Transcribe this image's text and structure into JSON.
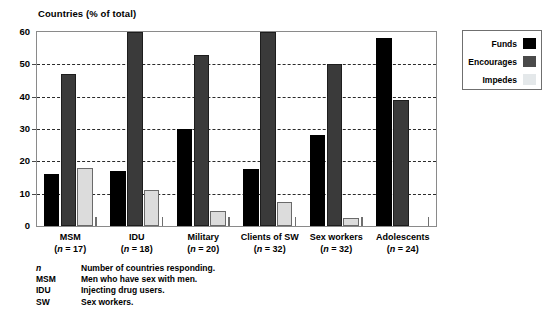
{
  "chart_data": {
    "type": "bar",
    "title": "Countries (% of total)",
    "ylabel": "Countries (% of total)",
    "xlabel": "",
    "ylim": [
      0,
      60
    ],
    "yticks": [
      0,
      10,
      20,
      30,
      40,
      50,
      60
    ],
    "ytick_labels": [
      "0",
      "10",
      "20",
      "30",
      "40",
      "50",
      "60"
    ],
    "grid": true,
    "grid_axis": "y",
    "legend_position": "outside-right-top",
    "categories": [
      "MSM",
      "IDU",
      "Military",
      "Clients of SW",
      "Sex workers",
      "Adolescents"
    ],
    "category_sublabels": [
      "(n = 17)",
      "(n = 18)",
      "(n = 20)",
      "(n = 32)",
      "(n = 32)",
      "(n = 24)"
    ],
    "category_n": [
      17,
      18,
      20,
      32,
      32,
      24
    ],
    "series": [
      {
        "name": "Funds",
        "color": "#000000",
        "values": [
          16,
          17,
          30,
          17.5,
          28,
          58
        ]
      },
      {
        "name": "Encourages",
        "color": "#3a3a3a",
        "values": [
          47,
          60,
          53,
          60,
          50,
          39
        ]
      },
      {
        "name": "Impedes",
        "color": "#dcdcdc",
        "values": [
          18,
          11,
          4.5,
          7.5,
          2.5,
          0
        ]
      }
    ]
  },
  "legend": {
    "items": [
      {
        "label": "Funds",
        "swatch": "funds"
      },
      {
        "label": "Encourages",
        "swatch": "encourages"
      },
      {
        "label": "Impedes",
        "swatch": "impedes"
      }
    ]
  },
  "footnotes": [
    {
      "key": "n",
      "key_italic": true,
      "text": "Number of countries responding."
    },
    {
      "key": "MSM",
      "key_italic": false,
      "text": "Men who have sex with men."
    },
    {
      "key": "IDU",
      "key_italic": false,
      "text": "Injecting drug users."
    },
    {
      "key": "SW",
      "key_italic": false,
      "text": "Sex workers."
    }
  ]
}
